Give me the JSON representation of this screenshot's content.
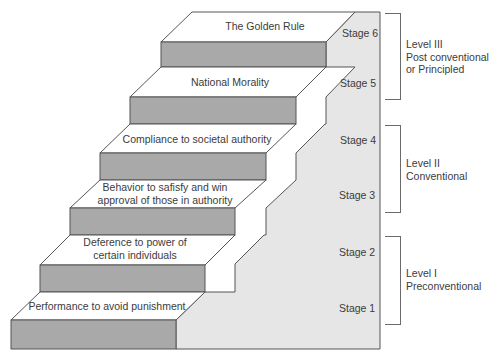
{
  "colors": {
    "tread": "#ffffff",
    "riser": "#a9a9a9",
    "backdrop": "#e6e6e6",
    "outline": "#555555",
    "text": "#3b3b3b"
  },
  "steps": [
    {
      "stage": "Stage 1",
      "label_lines": [
        "Performance to avoid punishment"
      ]
    },
    {
      "stage": "Stage 2",
      "label_lines": [
        "Deference to power of",
        "certain individuals"
      ]
    },
    {
      "stage": "Stage 3",
      "label_lines": [
        "Behavior to safisfy and win",
        "approval of those in authority"
      ]
    },
    {
      "stage": "Stage 4",
      "label_lines": [
        "Compliance to societal authority"
      ]
    },
    {
      "stage": "Stage 5",
      "label_lines": [
        "National Morality"
      ]
    },
    {
      "stage": "Stage 6",
      "label_lines": [
        "The Golden Rule"
      ]
    }
  ],
  "levels": [
    {
      "title": "Level III",
      "lines": [
        "Level III",
        "Post conventional",
        "or Principled"
      ],
      "stages": "Stage 5–6"
    },
    {
      "title": "Level II",
      "lines": [
        "Level II",
        "Conventional"
      ],
      "stages": "Stage 3–4"
    },
    {
      "title": "Level I",
      "lines": [
        "Level I",
        "Preconventional"
      ],
      "stages": "Stage 1–2"
    }
  ]
}
